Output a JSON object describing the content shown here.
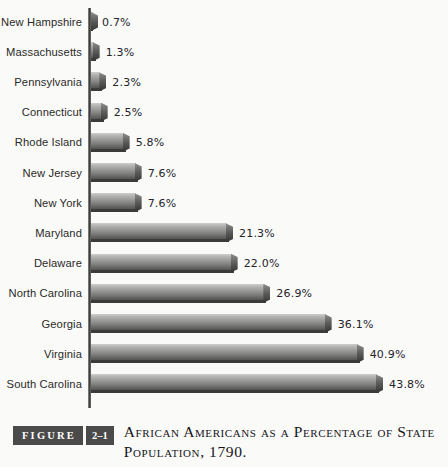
{
  "chart_data": {
    "type": "bar",
    "orientation": "horizontal",
    "title": "African Americans as a Percentage of State Population, 1790.",
    "figure_number": "2–1",
    "figure_word": "FIGURE",
    "xlabel": "",
    "ylabel": "",
    "xlim": [
      0,
      43.8
    ],
    "grid": false,
    "legend": null,
    "value_suffix": "%",
    "categories": [
      "New Hampshire",
      "Massachusetts",
      "Pennsylvania",
      "Connecticut",
      "Rhode Island",
      "New Jersey",
      "New York",
      "Maryland",
      "Delaware",
      "North Carolina",
      "Georgia",
      "Virginia",
      "South Carolina"
    ],
    "values": [
      0.7,
      1.3,
      2.3,
      2.5,
      5.8,
      7.6,
      7.6,
      21.3,
      22.0,
      26.9,
      36.1,
      40.9,
      43.8
    ],
    "value_labels": [
      "0.7%",
      "1.3%",
      "2.3%",
      "2.5%",
      "5.8%",
      "7.6%",
      "7.6%",
      "21.3%",
      "22.0%",
      "26.9%",
      "36.1%",
      "40.9%",
      "43.8%"
    ]
  },
  "caption": {
    "chip_label": "FIGURE",
    "chip_number": "2–1",
    "text": "African Americans as a Percentage of State Population, 1790."
  },
  "colors": {
    "background": "#fafaf8",
    "bar_top": "#cfcfcd",
    "bar_bottom": "#434341",
    "axis": "#3a3a38",
    "label_text": "#2a2a28",
    "chip_background": "#4a4a4a",
    "chip_text": "#ffffff"
  }
}
